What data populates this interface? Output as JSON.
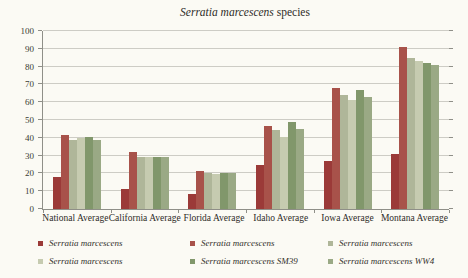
{
  "chart_data": {
    "type": "bar",
    "title_italic": "Serratia marcescens",
    "title_regular": " species",
    "categories": [
      "National Average",
      "California Average",
      "Florida Average",
      "Idaho Average",
      "Iowa Average",
      "Montana Average"
    ],
    "series": [
      {
        "name": "Serratia marcescens",
        "color": "#9b3a38",
        "values": [
          18,
          11.5,
          8.5,
          25,
          27,
          31
        ]
      },
      {
        "name": "Serratia marcescens",
        "color": "#a8524a",
        "values": [
          41.5,
          32,
          21.5,
          46.5,
          68,
          91
        ]
      },
      {
        "name": "Serratia marcescens",
        "color": "#afb699",
        "values": [
          39,
          29,
          20,
          44.5,
          64,
          85
        ]
      },
      {
        "name": "Serratia marcescens",
        "color": "#c6cbb0",
        "values": [
          40,
          29,
          19.5,
          40.5,
          61,
          83
        ]
      },
      {
        "name": "Serratia marcescens SM39",
        "color": "#81976b",
        "values": [
          40.5,
          29,
          20.5,
          49,
          67,
          82
        ]
      },
      {
        "name": "Serratia marcescens WW4",
        "color": "#9aa985",
        "values": [
          39,
          29,
          20.5,
          45,
          63,
          81
        ]
      }
    ],
    "ylim": [
      0,
      100
    ],
    "ytick_step": 10,
    "grid": true,
    "legend_position": "bottom",
    "legend_layout": [
      [
        0,
        1,
        2
      ],
      [
        3,
        4,
        5
      ]
    ]
  },
  "colors": {
    "background": "#fbfaf4",
    "grid": "#cdccc5",
    "axis": "#8f8f88",
    "text": "#2e2c28"
  }
}
